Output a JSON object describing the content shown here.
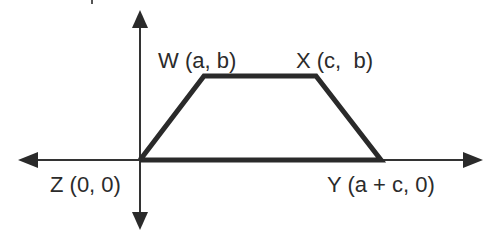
{
  "diagram": {
    "type": "coordinate-trapezoid",
    "stroke_color": "#2a2a2a",
    "axis_color": "#333333",
    "points": [
      {
        "id": "W",
        "label": "W (a, b)",
        "coords": [
          "a",
          "b"
        ]
      },
      {
        "id": "X",
        "label": "X (c,  b)",
        "coords": [
          "c",
          "b"
        ]
      },
      {
        "id": "Z",
        "label": "Z (0, 0)",
        "coords": [
          "0",
          "0"
        ]
      },
      {
        "id": "Y",
        "label": "Y (a + c, 0)",
        "coords": [
          "a + c",
          "0"
        ]
      }
    ],
    "shape_order": [
      "Z",
      "W",
      "X",
      "Y"
    ]
  }
}
